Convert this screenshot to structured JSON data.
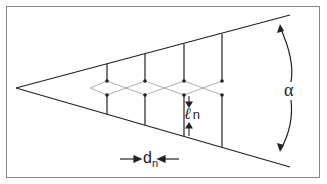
{
  "diagram": {
    "labels": {
      "angle": "α",
      "spacing": "d",
      "spacing_sub": "n",
      "length": "ℓ",
      "length_sub": "n"
    },
    "colors": {
      "line": "#222222",
      "frame": "#888888"
    }
  }
}
